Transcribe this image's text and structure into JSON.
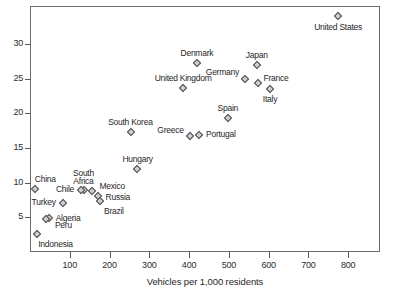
{
  "chart_data": {
    "type": "scatter",
    "title": "",
    "xlabel": "Vehicles per 1,000 residents",
    "ylabel": "",
    "xlim": [
      0,
      880
    ],
    "ylim": [
      0,
      35.5
    ],
    "xticks": [
      100,
      200,
      300,
      400,
      500,
      600,
      700,
      800
    ],
    "yticks": [
      5,
      10,
      15,
      20,
      25,
      30
    ],
    "grid": false,
    "legend": "none",
    "marker": "diamond",
    "points": [
      {
        "label": "United States",
        "x": 775,
        "y": 34.0
      },
      {
        "label": "Denmark",
        "x": 420,
        "y": 27.3
      },
      {
        "label": "Japan",
        "x": 570,
        "y": 27.0
      },
      {
        "label": "Germany",
        "x": 540,
        "y": 25.0
      },
      {
        "label": "France",
        "x": 572,
        "y": 24.4
      },
      {
        "label": "Italy",
        "x": 603,
        "y": 23.5
      },
      {
        "label": "United Kingdom",
        "x": 385,
        "y": 23.6
      },
      {
        "label": "Spain",
        "x": 498,
        "y": 19.3
      },
      {
        "label": "Greece",
        "x": 403,
        "y": 16.8
      },
      {
        "label": "Portugal",
        "x": 425,
        "y": 16.9
      },
      {
        "label": "South Korea",
        "x": 253,
        "y": 17.3
      },
      {
        "label": "Hungary",
        "x": 270,
        "y": 12.0
      },
      {
        "label": "China",
        "x": 12,
        "y": 9.1
      },
      {
        "label": "South Africa",
        "x": 137,
        "y": 9.0
      },
      {
        "label": "Chile",
        "x": 128,
        "y": 9.0
      },
      {
        "label": "Mexico",
        "x": 157,
        "y": 8.8
      },
      {
        "label": "Russia",
        "x": 170,
        "y": 8.1
      },
      {
        "label": "Brazil",
        "x": 176,
        "y": 7.3
      },
      {
        "label": "Turkey",
        "x": 82,
        "y": 7.0
      },
      {
        "label": "Algeria",
        "x": 47,
        "y": 4.9
      },
      {
        "label": "Peru",
        "x": 40,
        "y": 4.7
      },
      {
        "label": "Indonesia",
        "x": 18,
        "y": 2.6
      }
    ],
    "label_offsets": {
      "United States": {
        "dx": 0,
        "dy": 12,
        "align": "center"
      },
      "Denmark": {
        "dx": 0,
        "dy": -9,
        "align": "center"
      },
      "Japan": {
        "dx": 0,
        "dy": -9,
        "align": "center"
      },
      "Germany": {
        "dx": -6,
        "dy": -6,
        "align": "right"
      },
      "France": {
        "dx": 6,
        "dy": -4,
        "align": "left"
      },
      "Italy": {
        "dx": 0,
        "dy": 11,
        "align": "center"
      },
      "United Kingdom": {
        "dx": 0,
        "dy": -9,
        "align": "center"
      },
      "Spain": {
        "dx": 0,
        "dy": -9,
        "align": "center"
      },
      "Greece": {
        "dx": -7,
        "dy": -5,
        "align": "right"
      },
      "Portugal": {
        "dx": 7,
        "dy": 0,
        "align": "left"
      },
      "South Korea": {
        "dx": 0,
        "dy": -9,
        "align": "center"
      },
      "Hungary": {
        "dx": 0,
        "dy": -9,
        "align": "center"
      },
      "China": {
        "dx": 0,
        "dy": -9,
        "align": "left"
      },
      "South Africa": {
        "dx": -1,
        "dy": -12,
        "align": "center"
      },
      "Chile": {
        "dx": -7,
        "dy": 0,
        "align": "right"
      },
      "Mexico": {
        "dx": 7,
        "dy": -4,
        "align": "left"
      },
      "Russia": {
        "dx": 8,
        "dy": 2,
        "align": "left"
      },
      "Brazil": {
        "dx": 4,
        "dy": 11,
        "align": "left"
      },
      "Turkey": {
        "dx": -7,
        "dy": 0,
        "align": "right"
      },
      "Algeria": {
        "dx": 7,
        "dy": 1,
        "align": "left"
      },
      "Peru": {
        "dx": 9,
        "dy": 7,
        "align": "left"
      },
      "Indonesia": {
        "dx": 1,
        "dy": 11,
        "align": "left"
      }
    },
    "colors": {
      "marker_fill": "#cfcfcf",
      "marker_stroke": "#4a4a4a",
      "axis": "#6e6e6e",
      "text": "#1f1f1f",
      "background": "#ffffff"
    }
  }
}
